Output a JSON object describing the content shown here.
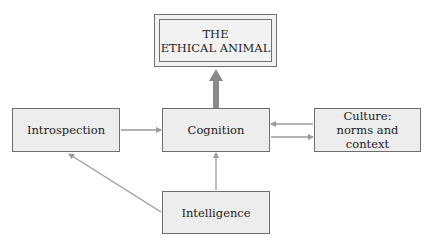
{
  "diagram": {
    "nodes": {
      "ethical_animal": {
        "lines": [
          "THE",
          "ETHICAL ANIMAL"
        ]
      },
      "introspection": {
        "label": "Introspection"
      },
      "cognition": {
        "label": "Cognition"
      },
      "culture": {
        "lines": [
          "Culture:",
          "norms and context"
        ]
      },
      "intelligence": {
        "label": "Intelligence"
      }
    },
    "edges": [
      {
        "from": "Cognition",
        "to": "THE ETHICAL ANIMAL",
        "style": "thick"
      },
      {
        "from": "Introspection",
        "to": "Cognition",
        "style": "thin"
      },
      {
        "from": "Culture: norms and context",
        "to": "Cognition",
        "style": "thin"
      },
      {
        "from": "Cognition",
        "to": "Culture: norms and context",
        "style": "thin"
      },
      {
        "from": "Intelligence",
        "to": "Cognition",
        "style": "thin"
      },
      {
        "from": "Intelligence",
        "to": "Introspection",
        "style": "thin"
      }
    ],
    "colors": {
      "box_fill": "#ededed",
      "box_border": "#6e6e6e",
      "arrow": "#9a9a9a",
      "thick_arrow": "#8a8a8a"
    }
  }
}
